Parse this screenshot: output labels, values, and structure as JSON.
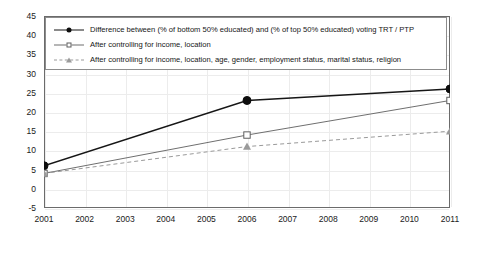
{
  "chart_data": {
    "type": "line",
    "title": "",
    "subtitle": "",
    "xlabel": "",
    "ylabel": "",
    "x": [
      2001,
      2006,
      2011
    ],
    "xlim": [
      2001,
      2011
    ],
    "ylim": [
      -5,
      45
    ],
    "ytick_labels": [
      "45",
      "40",
      "35",
      "30",
      "25",
      "20",
      "15",
      "10",
      "5",
      "0",
      "-5"
    ],
    "ytick_values": [
      45,
      40,
      35,
      30,
      25,
      20,
      15,
      10,
      5,
      0,
      -5
    ],
    "xtick_labels": [
      "2001",
      "2002",
      "2003",
      "2004",
      "2005",
      "2006",
      "2007",
      "2008",
      "2009",
      "2010",
      "2011"
    ],
    "xtick_values": [
      2001,
      2002,
      2003,
      2004,
      2005,
      2006,
      2007,
      2008,
      2009,
      2010,
      2011
    ],
    "grid": true,
    "legend_position": "top-left",
    "reference_lines": [
      {
        "axis": "y",
        "value": 0,
        "style": "dashed",
        "color": "#2b2b2b"
      }
    ],
    "series": [
      {
        "name": "Difference between (% of bottom 50% educated) and (% of top 50% educated) voting TRT / PTP",
        "marker": "filled-circle",
        "line_style": "solid",
        "color": "#161616",
        "x": [
          2001,
          2006,
          2011
        ],
        "values": [
          6,
          23,
          26
        ]
      },
      {
        "name": "After controlling for income, location",
        "marker": "open-square",
        "line_style": "solid",
        "color": "#6f6f6f",
        "x": [
          2001,
          2006,
          2011
        ],
        "values": [
          4,
          14,
          23
        ]
      },
      {
        "name": "After controlling for income, location, age, gender, employment status, marital status, religion",
        "marker": "filled-triangle",
        "line_style": "dashed",
        "color": "#9a9a9a",
        "x": [
          2001,
          2006,
          2011
        ],
        "values": [
          4,
          11,
          15
        ]
      }
    ]
  },
  "legend": {
    "items": [
      {
        "label": "Difference between (% of bottom 50% educated) and (% of top 50% educated) voting TRT / PTP"
      },
      {
        "label": "After controlling for income, location"
      },
      {
        "label": "After controlling for income, location, age, gender, employment status, marital status, religion"
      }
    ]
  }
}
